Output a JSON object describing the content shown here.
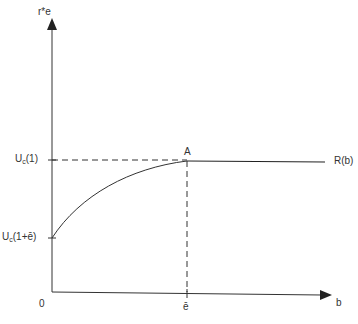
{
  "diagram": {
    "y_axis_label": "r*e",
    "x_axis_label": "b",
    "origin_label": "0",
    "x_tick_label": "ē",
    "y_ticks": [
      {
        "prefix": "U",
        "sub": "c",
        "suffix": "(1)"
      },
      {
        "prefix": "U",
        "sub": "c",
        "suffix": "(1+ē)"
      }
    ],
    "point_label": "A",
    "curve_label": "R(b)",
    "colors": {
      "line": "#222222",
      "text": "#333333"
    }
  }
}
